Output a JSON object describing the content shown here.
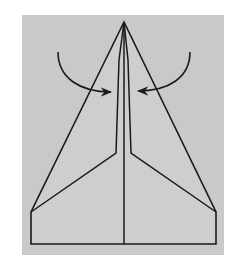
{
  "diagram": {
    "background_color": "#ffffff",
    "panel_color": "#c9c9c9",
    "paper_color": "#cdcdcd",
    "line_color": "#1a1a1a",
    "panel": {
      "x": 22,
      "y": 15,
      "w": 202,
      "h": 240
    },
    "apex": [
      124,
      22
    ],
    "outline": [
      [
        124,
        22
      ],
      [
        31,
        212
      ],
      [
        31,
        244
      ],
      [
        216,
        244
      ],
      [
        216,
        212
      ]
    ],
    "fold_left": [
      [
        31,
        212
      ],
      [
        116,
        153
      ],
      [
        119,
        60
      ],
      [
        124,
        22
      ]
    ],
    "fold_right": [
      [
        216,
        212
      ],
      [
        131,
        153
      ],
      [
        128,
        60
      ],
      [
        124,
        22
      ]
    ],
    "center_line": [
      [
        124,
        22
      ],
      [
        124,
        244
      ]
    ],
    "arrows": [
      {
        "name": "left-fold-arrow",
        "direction": "inward-right",
        "start": [
          58,
          52
        ],
        "tip": [
          112,
          92
        ]
      },
      {
        "name": "right-fold-arrow",
        "direction": "inward-left",
        "start": [
          190,
          52
        ],
        "tip": [
          137,
          91
        ]
      }
    ]
  }
}
